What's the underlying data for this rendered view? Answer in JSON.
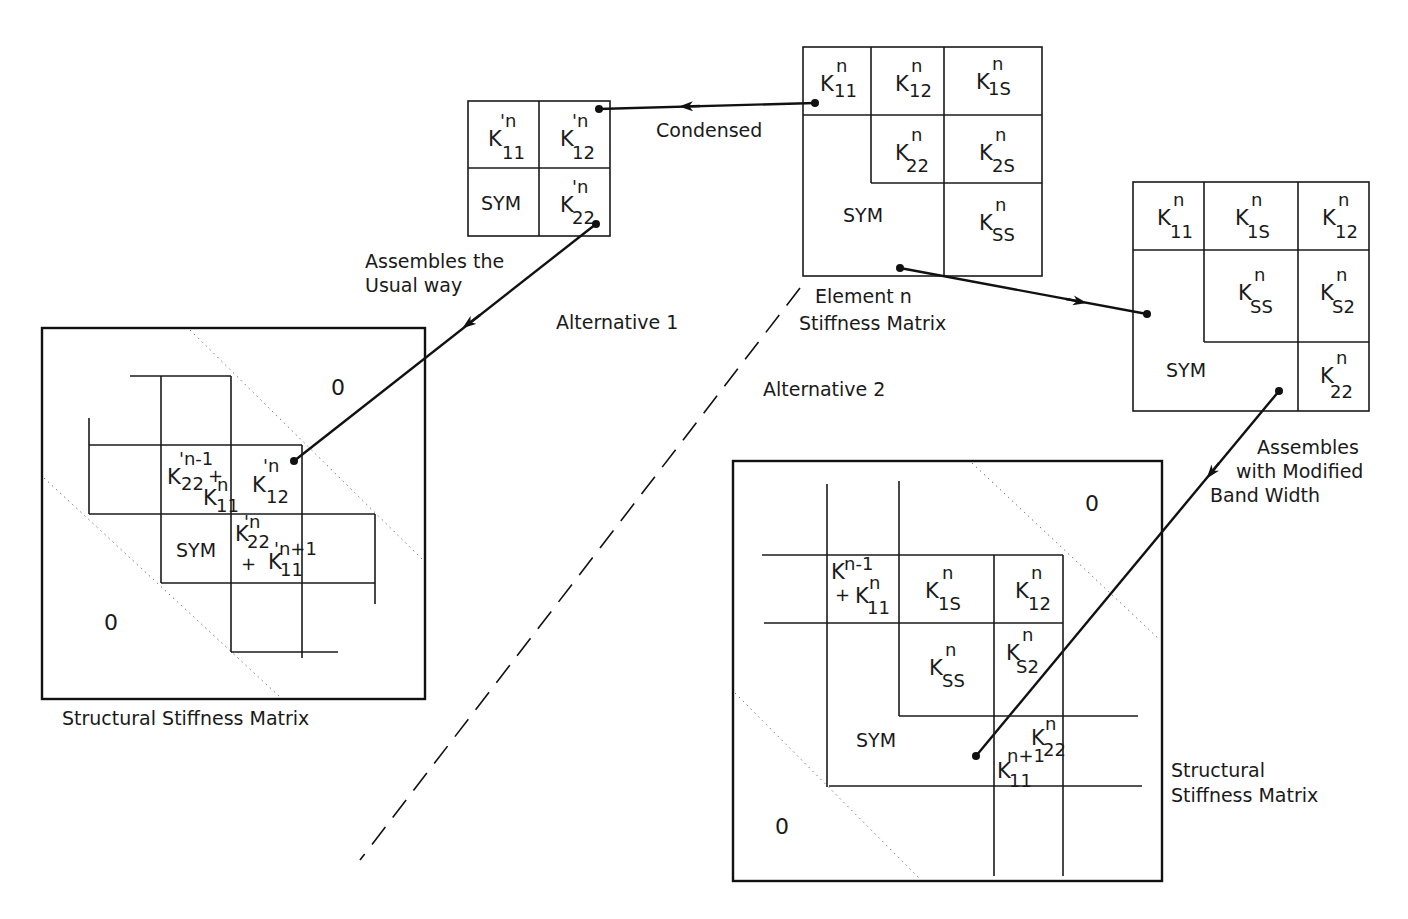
{
  "labels": {
    "condensed": "Condensed",
    "assembles_usual_1": "Assembles the",
    "assembles_usual_2": "Usual way",
    "alternative_1": "Alternative 1",
    "alternative_2": "Alternative 2",
    "element_n_1": "Element n",
    "element_n_2": "Stiffness Matrix",
    "assembles_mod_1": "Assembles",
    "assembles_mod_2": "with Modified",
    "assembles_mod_3": "Band Width",
    "structural_left": "Structural Stiffness Matrix",
    "structural_right_1": "Structural",
    "structural_right_2": "Stiffness Matrix",
    "zero": "0",
    "sym": "SYM",
    "plus": "+"
  },
  "element_matrix": {
    "title": "Element n Stiffness Matrix",
    "cells": [
      {
        "sym": "K",
        "sup": "n",
        "sub": "11"
      },
      {
        "sym": "K",
        "sup": "n",
        "sub": "12"
      },
      {
        "sym": "K",
        "sup": "n",
        "sub": "1S"
      },
      {
        "sym": "K",
        "sup": "n",
        "sub": "22"
      },
      {
        "sym": "K",
        "sup": "n",
        "sub": "2S"
      },
      {
        "sym": "K",
        "sup": "n",
        "sub": "SS"
      }
    ]
  },
  "condensed_matrix": {
    "cells": [
      {
        "sym": "K",
        "sup": "'n",
        "sub": "11"
      },
      {
        "sym": "K",
        "sup": "'n",
        "sub": "12"
      },
      {
        "sym": "K",
        "sup": "'n",
        "sub": "22"
      }
    ]
  },
  "reordered_matrix": {
    "cells": [
      {
        "sym": "K",
        "sup": "n",
        "sub": "11"
      },
      {
        "sym": "K",
        "sup": "n",
        "sub": "1S"
      },
      {
        "sym": "K",
        "sup": "n",
        "sub": "12"
      },
      {
        "sym": "K",
        "sup": "n",
        "sub": "SS"
      },
      {
        "sym": "K",
        "sup": "n",
        "sub": "S2"
      },
      {
        "sym": "K",
        "sup": "n",
        "sub": "22"
      }
    ]
  },
  "structural_left": {
    "cells": [
      {
        "sym": "K",
        "sup": "'n-1",
        "sub": "22"
      },
      {
        "sym": "K",
        "sup": "n",
        "sub": "11"
      },
      {
        "sym": "K",
        "sup": "'n",
        "sub": "12"
      },
      {
        "sym": "K",
        "sup": "'n",
        "sub": "22"
      },
      {
        "sym": "K",
        "sup": "'n+1",
        "sub": "11"
      }
    ]
  },
  "structural_right": {
    "cells": [
      {
        "sym": "K",
        "sup": "n-1",
        "sub": ""
      },
      {
        "sym": "K",
        "sup": "n",
        "sub": "11"
      },
      {
        "sym": "K",
        "sup": "n",
        "sub": "1S"
      },
      {
        "sym": "K",
        "sup": "n",
        "sub": "12"
      },
      {
        "sym": "K",
        "sup": "n",
        "sub": "SS"
      },
      {
        "sym": "K",
        "sup": "n",
        "sub": "S2"
      },
      {
        "sym": "K",
        "sup": "n",
        "sub": "22"
      },
      {
        "sym": "K",
        "sup": "n+1",
        "sub": "11"
      }
    ]
  }
}
